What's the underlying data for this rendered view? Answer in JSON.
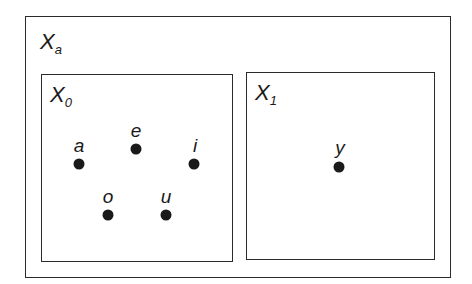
{
  "diagram": {
    "outer_set": {
      "name": "X",
      "subscript": "a",
      "box": {
        "left": 25,
        "top": 16,
        "width": 426,
        "height": 262
      }
    },
    "subsets": [
      {
        "name": "X",
        "subscript": "0",
        "box": {
          "left": 41,
          "top": 74,
          "width": 192,
          "height": 188
        },
        "points": [
          {
            "label": "a",
            "x": 79,
            "y": 164
          },
          {
            "label": "e",
            "x": 136,
            "y": 149
          },
          {
            "label": "i",
            "x": 194,
            "y": 164
          },
          {
            "label": "o",
            "x": 108,
            "y": 215
          },
          {
            "label": "u",
            "x": 166,
            "y": 215
          }
        ]
      },
      {
        "name": "X",
        "subscript": "1",
        "box": {
          "left": 246,
          "top": 72,
          "width": 189,
          "height": 188
        },
        "points": [
          {
            "label": "y",
            "x": 339,
            "y": 167
          }
        ]
      }
    ],
    "colors": {
      "stroke": "#2a2a2a",
      "dot": "#1a1a1a",
      "background": "#ffffff"
    }
  }
}
